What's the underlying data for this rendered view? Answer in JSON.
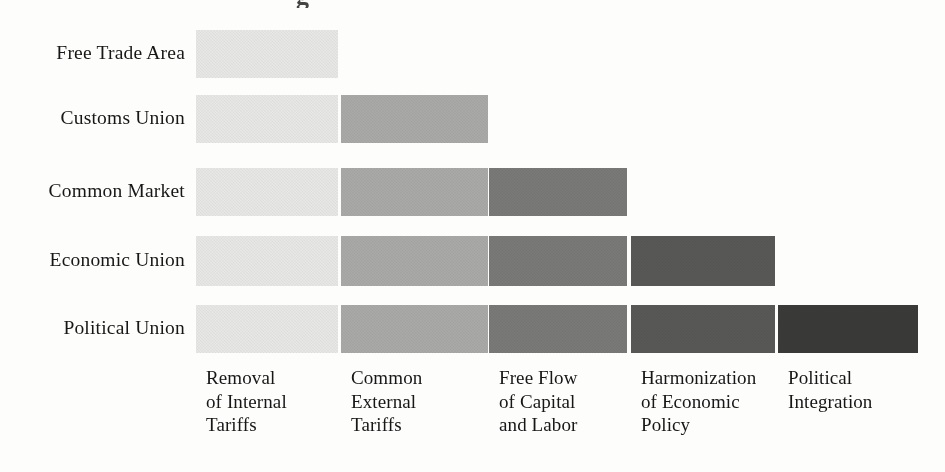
{
  "figure": {
    "title_remnant": "g",
    "background_color": "#fdfdfc",
    "text_color": "#171717",
    "width": 945,
    "height": 472
  },
  "chart_data": {
    "type": "bar",
    "title": "",
    "subtitle": "",
    "xlabel": "",
    "ylabel": "",
    "orientation": "horizontal-stacked-staircase",
    "grid": false,
    "legend": "none",
    "categories": [
      "Free Trade Area",
      "Customs Union",
      "Common Market",
      "Economic Union",
      "Political Union"
    ],
    "components": [
      "Removal of Internal Tariffs",
      "Common External Tariffs",
      "Free Flow of Capital and Labor",
      "Harmonization of Economic Policy",
      "Political Integration"
    ],
    "component_labels_wrapped": [
      "Removal\nof Internal\nTariffs",
      "Common\nExternal\nTariffs",
      "Free Flow\nof Capital\nand Labor",
      "Harmonization\nof Economic\nPolicy",
      "Political\nIntegration"
    ],
    "component_colors": [
      "#e7e7e6",
      "#a9a9a7",
      "#797977",
      "#585856",
      "#3a3a39"
    ],
    "matrix": [
      [
        1,
        0,
        0,
        0,
        0
      ],
      [
        1,
        1,
        0,
        0,
        0
      ],
      [
        1,
        1,
        1,
        0,
        0
      ],
      [
        1,
        1,
        1,
        1,
        0
      ],
      [
        1,
        1,
        1,
        1,
        1
      ]
    ],
    "values": [
      1,
      2,
      3,
      4,
      5
    ],
    "ylim": [
      0,
      5
    ],
    "note": "Each row shows which integration components a stage includes; stages accumulate components cumulatively."
  },
  "rows": [
    {
      "label": "Free Trade Area",
      "count": 1,
      "label_y": 42,
      "bar_top": 30,
      "bar_height": 48
    },
    {
      "label": "Customs Union",
      "count": 2,
      "label_y": 107,
      "bar_top": 95,
      "bar_height": 48
    },
    {
      "label": "Common Market",
      "count": 3,
      "label_y": 180,
      "bar_top": 168,
      "bar_height": 48
    },
    {
      "label": "Economic Union",
      "count": 4,
      "label_y": 249,
      "bar_top": 236,
      "bar_height": 50
    },
    {
      "label": "Political Union",
      "count": 5,
      "label_y": 317,
      "bar_top": 305,
      "bar_height": 48
    }
  ],
  "columns": [
    {
      "label": "Removal\nof Internal\nTariffs",
      "color": "#e7e7e6",
      "x": 196,
      "width": 142
    },
    {
      "label": "Common\nExternal\nTariffs",
      "color": "#a9a9a7",
      "x": 341,
      "width": 147
    },
    {
      "label": "Free Flow\nof Capital\nand Labor",
      "color": "#797977",
      "x": 489,
      "width": 138
    },
    {
      "label": "Harmonization\nof Economic\nPolicy",
      "color": "#585856",
      "x": 631,
      "width": 144
    },
    {
      "label": "Political\nIntegration",
      "color": "#3a3a39",
      "x": 778,
      "width": 140
    }
  ]
}
